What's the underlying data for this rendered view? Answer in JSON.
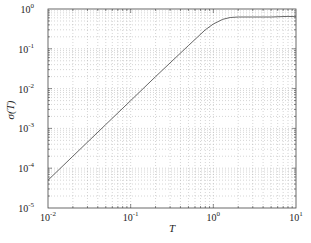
{
  "chart_data": {
    "type": "line",
    "title": "",
    "xlabel": "T",
    "ylabel": "σ(T)",
    "xscale": "log",
    "yscale": "log",
    "xlim": [
      0.01,
      10
    ],
    "ylim": [
      1e-05,
      1
    ],
    "grid": true,
    "grid_style": "dotted, major and minor",
    "legend": null,
    "x_ticks": [
      "10^-2",
      "10^-1",
      "10^0",
      "10^1"
    ],
    "y_ticks": [
      "10^-5",
      "10^-4",
      "10^-3",
      "10^-2",
      "10^-1",
      "10^0"
    ],
    "series": [
      {
        "name": "σ(T)",
        "color": "#555555",
        "x": [
          0.01,
          0.02,
          0.05,
          0.1,
          0.2,
          0.5,
          0.8,
          1.0,
          1.3,
          1.6,
          2.0,
          3.0,
          5.0,
          8.0,
          10.0
        ],
        "y": [
          5e-05,
          0.0002,
          0.00125,
          0.005,
          0.02,
          0.12,
          0.3,
          0.42,
          0.55,
          0.61,
          0.63,
          0.63,
          0.63,
          0.65,
          0.64
        ]
      }
    ]
  },
  "axes": {
    "x_label": "T",
    "y_label": "σ(T)",
    "x_tick_labels": [
      {
        "base": "10",
        "exp": "-2"
      },
      {
        "base": "10",
        "exp": "-1"
      },
      {
        "base": "10",
        "exp": "0"
      },
      {
        "base": "10",
        "exp": "1"
      }
    ],
    "y_tick_labels": [
      {
        "base": "10",
        "exp": "0"
      },
      {
        "base": "10",
        "exp": "-1"
      },
      {
        "base": "10",
        "exp": "-2"
      },
      {
        "base": "10",
        "exp": "-3"
      },
      {
        "base": "10",
        "exp": "-4"
      },
      {
        "base": "10",
        "exp": "-5"
      }
    ]
  }
}
